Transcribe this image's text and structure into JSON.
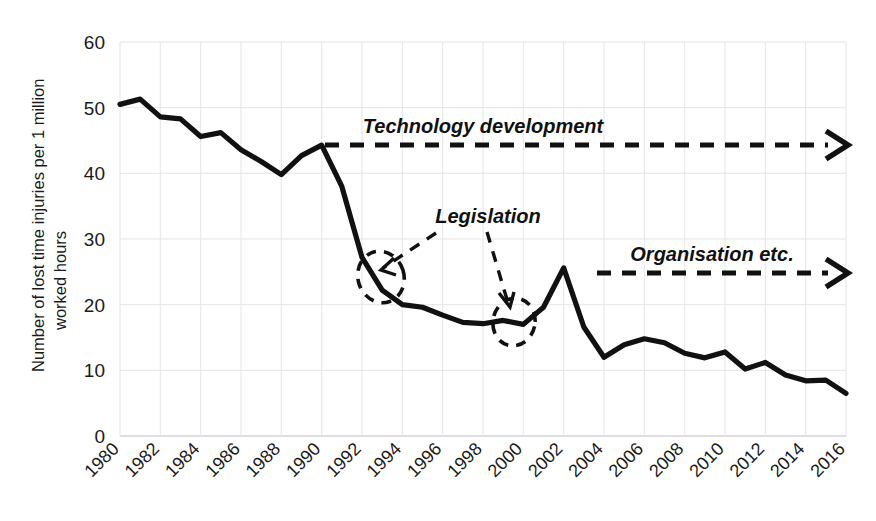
{
  "chart_data": {
    "type": "line",
    "title": "",
    "xlabel": "",
    "ylabel": "Number of lost time injuries per 1 million worked hours",
    "ylabel_line1": "Number of lost time injuries per 1 million",
    "ylabel_line2": "worked hours",
    "xlim": [
      1980,
      2016
    ],
    "ylim": [
      0,
      60
    ],
    "ytick_step": 10,
    "xtick_step": 2,
    "grid": true,
    "legend": "none",
    "line_color": "#111111",
    "grid_color": "#e4e4ea",
    "yticks": [
      "60",
      "50",
      "40",
      "30",
      "20",
      "10",
      "0"
    ],
    "ytick_values": [
      60,
      50,
      40,
      30,
      20,
      10,
      0
    ],
    "xticks": [
      "1980",
      "1982",
      "1984",
      "1986",
      "1988",
      "1990",
      "1992",
      "1994",
      "1996",
      "1998",
      "2000",
      "2002",
      "2004",
      "2006",
      "2008",
      "2010",
      "2012",
      "2014",
      "2016"
    ],
    "x": [
      1980,
      1981,
      1982,
      1983,
      1984,
      1985,
      1986,
      1987,
      1988,
      1989,
      1990,
      1991,
      1992,
      1993,
      1994,
      1995,
      1996,
      1997,
      1998,
      1999,
      2000,
      2001,
      2002,
      2003,
      2004,
      2005,
      2006,
      2007,
      2008,
      2009,
      2010,
      2011,
      2012,
      2013,
      2014,
      2015,
      2016
    ],
    "values": [
      50.5,
      51.3,
      48.6,
      48.3,
      45.6,
      46.2,
      43.6,
      41.8,
      39.8,
      42.7,
      44.3,
      38.0,
      27.2,
      22.2,
      20.0,
      19.6,
      18.4,
      17.3,
      17.1,
      17.6,
      17.0,
      19.6,
      25.6,
      16.6,
      12.0,
      13.9,
      14.8,
      14.2,
      12.6,
      11.9,
      12.8,
      10.2,
      11.2,
      9.3,
      8.4,
      8.5,
      6.5
    ],
    "series": [
      {
        "name": "Lost time injury rate",
        "values": [
          50.5,
          51.3,
          48.6,
          48.3,
          45.6,
          46.2,
          43.6,
          41.8,
          39.8,
          42.7,
          44.3,
          38.0,
          27.2,
          22.2,
          20.0,
          19.6,
          18.4,
          17.3,
          17.1,
          17.6,
          17.0,
          19.6,
          25.6,
          16.6,
          12.0,
          13.9,
          14.8,
          14.2,
          12.6,
          11.9,
          12.8,
          10.2,
          11.2,
          9.3,
          8.4,
          8.5,
          6.5
        ]
      }
    ],
    "annotations": [
      {
        "id": "technology-development",
        "text": "Technology development",
        "style": "bold-italic",
        "arrow": "dashed-right-arrow",
        "x_start": 1990,
        "x_end": 2016,
        "y": 44.3
      },
      {
        "id": "organisation-etc",
        "text": "Organisation etc.",
        "style": "bold-italic",
        "arrow": "dashed-right-arrow",
        "x_start": 2003,
        "x_end": 2016,
        "y": 25.0
      },
      {
        "id": "legislation",
        "text": "Legislation",
        "style": "bold-italic",
        "arrow": "two-dashed-pointers",
        "targets": [
          {
            "x": 1993,
            "y": 24.5
          },
          {
            "x": 2000,
            "y": 18.5
          }
        ]
      }
    ]
  },
  "axes": {
    "y_title_line1": "Number of lost time injuries per 1 million",
    "y_title_line2": "worked hours"
  }
}
